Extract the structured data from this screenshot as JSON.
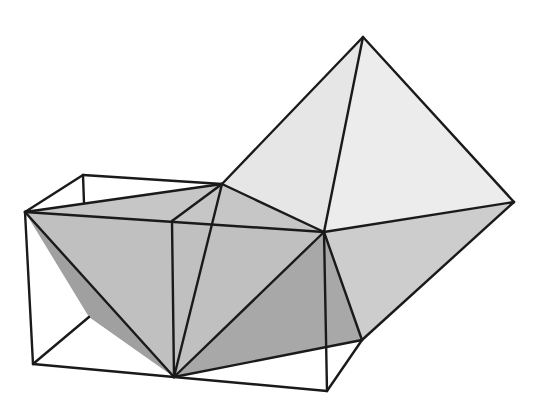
{
  "figure": {
    "title": "",
    "colors": {
      "background": "#ffffff",
      "edge": "#1a1a1a",
      "face_light": "#e4e4e4",
      "face_mid": "#c4c4c4",
      "face_dark": "#a8a8a8",
      "face_darker": "#9a9a9a"
    },
    "vertices": {
      "apex": [
        363,
        37
      ],
      "right": [
        514,
        202
      ],
      "center": [
        324,
        232
      ],
      "left": [
        25,
        212
      ],
      "box_top_left": [
        83,
        175
      ],
      "top_mid": [
        222,
        184
      ],
      "box_inner_top": [
        172,
        221
      ],
      "bottom": [
        174,
        377
      ],
      "box_bottom_right": [
        327,
        391
      ],
      "box_bottom_left": [
        33,
        364
      ],
      "right_inner": [
        362,
        340
      ],
      "left_inner": [
        89,
        317
      ]
    }
  }
}
